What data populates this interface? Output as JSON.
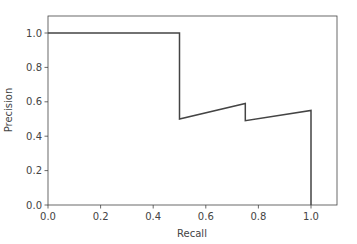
{
  "chart_data": {
    "type": "line",
    "title": "",
    "xlabel": "Recall",
    "ylabel": "Precision",
    "xlim": [
      0.0,
      1.1
    ],
    "ylim": [
      0.0,
      1.1
    ],
    "grid": false,
    "legend": null,
    "xticks": [
      0.0,
      0.2,
      0.4,
      0.6,
      0.8,
      1.0
    ],
    "xtick_labels": [
      "0.0",
      "0.2",
      "0.4",
      "0.6",
      "0.8",
      "1.0"
    ],
    "yticks": [
      0.0,
      0.2,
      0.4,
      0.6,
      0.8,
      1.0
    ],
    "ytick_labels": [
      "0.0",
      "0.2",
      "0.4",
      "0.6",
      "0.8",
      "1.0"
    ],
    "series": [
      {
        "name": "precision-recall",
        "color": "#444444",
        "x": [
          0.0,
          0.5,
          0.5,
          0.75,
          0.75,
          1.0,
          1.0
        ],
        "y": [
          1.0,
          1.0,
          0.5,
          0.59,
          0.49,
          0.55,
          0.0
        ]
      }
    ]
  },
  "colors": {
    "line": "#444444",
    "axes": "#444444",
    "text": "#444444",
    "background": "#ffffff"
  }
}
